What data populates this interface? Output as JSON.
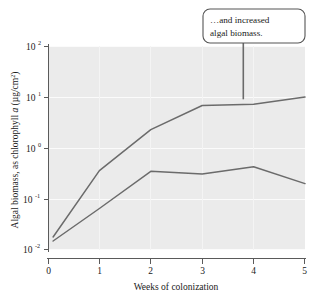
{
  "chart_data": {
    "type": "line",
    "title": "",
    "xlabel": "Weeks of colonization",
    "ylabel": "Algal biomass, as chlorophyll a (µg/cm²)",
    "ylabel_parts": {
      "lead": "Algal biomass, as chlorophyll ",
      "italic": "a",
      "units_open": " (µg/cm",
      "units_sup": "2",
      "units_close": ")"
    },
    "yscale": "log",
    "xscale": "linear",
    "xlim": [
      0,
      5
    ],
    "ylim": [
      0.01,
      100
    ],
    "grid": true,
    "legend": "none",
    "xticks": [
      0,
      1,
      2,
      3,
      4,
      5
    ],
    "xtick_labels": [
      "0",
      "1",
      "2",
      "3",
      "4",
      "5"
    ],
    "yticks": [
      0.01,
      0.1,
      1,
      10,
      100
    ],
    "ytick_labels": [
      {
        "base": "10",
        "exp": "-2"
      },
      {
        "base": "10",
        "exp": "-1"
      },
      {
        "base": "10",
        "exp": "0"
      },
      {
        "base": "10",
        "exp": "1"
      },
      {
        "base": "10",
        "exp": "2"
      }
    ],
    "x": [
      0.1,
      1,
      2,
      3,
      4,
      5
    ],
    "series": [
      {
        "name": "upper-curve",
        "color": "#6b6b6b",
        "values": [
          0.018,
          0.36,
          2.3,
          6.8,
          7.2,
          10.0
        ]
      },
      {
        "name": "lower-curve",
        "color": "#6b6b6b",
        "values": [
          0.015,
          0.065,
          0.35,
          0.31,
          0.43,
          0.2
        ]
      }
    ],
    "annotations": [
      {
        "name": "increased-biomass-callout",
        "lines": [
          "…and increased",
          "algal biomass."
        ],
        "anchor_x": 3.8,
        "anchor_y": 9.0
      }
    ]
  },
  "colors": {
    "plot_background": "#ebebeb",
    "gridline": "#fbfbfb",
    "axis": "#5a5a5a",
    "line": "#6b6b6b",
    "callout_border": "#555555",
    "callout_fill": "#ffffff",
    "page_background": "#ffffff"
  }
}
